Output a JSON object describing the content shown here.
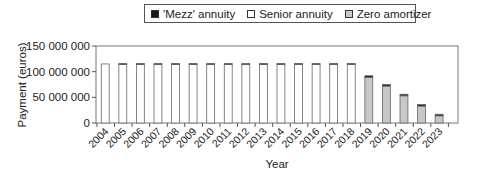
{
  "chart_data": {
    "type": "bar",
    "stacked": true,
    "title": "",
    "xlabel": "Year",
    "ylabel": "Payment (euros)",
    "ylim": [
      0,
      150000000
    ],
    "yticks": [
      0,
      50000000,
      100000000,
      150000000
    ],
    "ytick_labels": [
      "0",
      "50 000 000",
      "100 000 000",
      "150 000 000"
    ],
    "grid": false,
    "legend_position": "top",
    "categories": [
      "2004",
      "2005",
      "2006",
      "2007",
      "2008",
      "2009",
      "2010",
      "2011",
      "2012",
      "2013",
      "2014",
      "2015",
      "2016",
      "2017",
      "2018",
      "2019",
      "2020",
      "2021",
      "2022",
      "2023"
    ],
    "series": [
      {
        "name": "Senior annuity",
        "color": "#ffffff",
        "values": [
          115000000,
          114000000,
          114000000,
          114000000,
          114000000,
          114000000,
          114000000,
          114000000,
          114000000,
          114000000,
          114000000,
          114000000,
          114000000,
          114000000,
          114000000,
          0,
          0,
          0,
          0,
          0
        ]
      },
      {
        "name": "Zero amortizer",
        "color": "#c8c8c8",
        "values": [
          0,
          0,
          0,
          0,
          0,
          0,
          0,
          0,
          0,
          0,
          0,
          0,
          0,
          0,
          0,
          89000000,
          72000000,
          53000000,
          33000000,
          14000000
        ]
      },
      {
        "name": "'Mezz' annuity",
        "color": "#1a1a1a",
        "values": [
          0,
          2000000,
          2000000,
          2000000,
          2000000,
          2000000,
          2000000,
          2000000,
          2000000,
          2000000,
          2000000,
          2000000,
          2000000,
          2000000,
          2000000,
          3000000,
          3000000,
          3000000,
          3000000,
          3000000
        ]
      }
    ]
  },
  "legend": [
    {
      "label": "'Mezz' annuity",
      "color": "#1a1a1a"
    },
    {
      "label": "Senior annuity",
      "color": "#ffffff"
    },
    {
      "label": "Zero amortizer",
      "color": "#c8c8c8"
    }
  ]
}
